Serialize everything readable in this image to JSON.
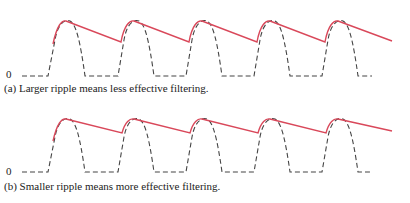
{
  "panels": [
    {
      "id": "a",
      "zero_label": "0",
      "caption": "(a) Larger ripple means less effective filtering.",
      "ripple": "larger"
    },
    {
      "id": "b",
      "zero_label": "0",
      "caption": "(b) Smaller ripple means more effective filtering.",
      "ripple": "smaller"
    }
  ],
  "colors": {
    "filtered_output": "#d9485a",
    "rectified_input": "#444444"
  }
}
